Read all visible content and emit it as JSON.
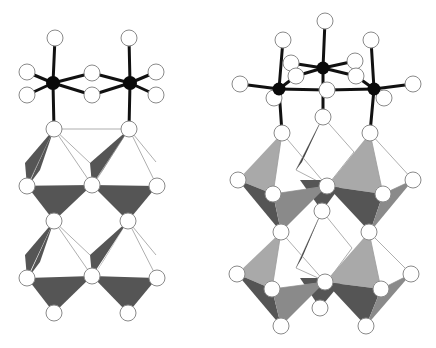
{
  "figure": {
    "colors": {
      "background": "#ffffff",
      "metal_atom": "#0a0a0a",
      "ligand_atom": "#ffffff",
      "atom_outline": "#8a8a8a",
      "bond": "#111111",
      "dark_face": "#555555",
      "mid_face": "#888888",
      "light_face": "#a9a9a9"
    },
    "panels": [
      {
        "name": "left-panel",
        "metal_atoms": 2,
        "polyhedra_rows": 2,
        "polyhedra_per_row": 2
      },
      {
        "name": "right-panel",
        "metal_atoms": 3,
        "polyhedra_rows": 2,
        "polyhedra_per_row": 2
      }
    ]
  }
}
